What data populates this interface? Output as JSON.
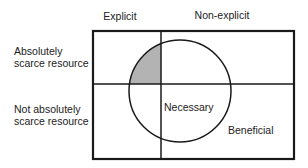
{
  "diagram": {
    "columns": {
      "explicit": "Explicit",
      "non_explicit": "Non-explicit"
    },
    "rows": {
      "absolutely_scarce": [
        "Absolutely",
        "scarce resource"
      ],
      "not_absolutely_scarce": [
        "Not absolutely",
        "scarce resource"
      ]
    },
    "regions": {
      "circle_label": "Necessary",
      "outer_label": "Beneficial"
    },
    "colors": {
      "line": "#1a1a1a",
      "shaded": "#b3b3b3",
      "background": "#ffffff"
    }
  }
}
